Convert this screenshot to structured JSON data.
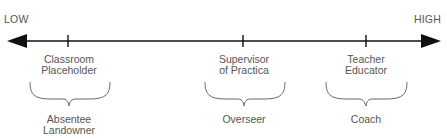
{
  "diagram": {
    "type": "continuum",
    "scale": {
      "low_label": "LOW",
      "high_label": "HIGH",
      "axis_color": "#111111",
      "text_color": "#555555"
    },
    "points": [
      {
        "position_x": 68,
        "label_line1": "Classroom",
        "label_line2": "Placeholder",
        "role_line1": "Absentee",
        "role_line2": "Landowner"
      },
      {
        "position_x": 243,
        "label_line1": "Supervisor",
        "label_line2": "of Practica",
        "role_line1": "Overseer",
        "role_line2": ""
      },
      {
        "position_x": 366,
        "label_line1": "Teacher",
        "label_line2": "Educator",
        "role_line1": "Coach",
        "role_line2": ""
      }
    ]
  }
}
